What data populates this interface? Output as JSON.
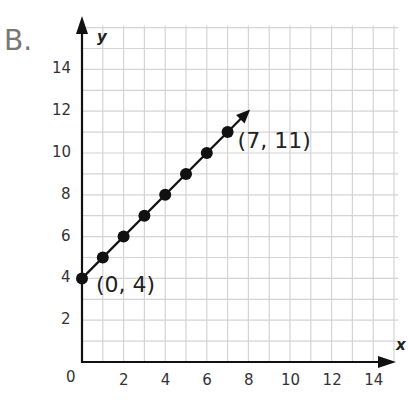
{
  "part_label": "B.",
  "chart_data": {
    "type": "line",
    "title": "",
    "xlabel": "x",
    "ylabel": "y",
    "xlim": [
      0,
      15
    ],
    "ylim": [
      0,
      16
    ],
    "grid": true,
    "x_ticks": [
      "2",
      "4",
      "6",
      "8",
      "10",
      "12",
      "14"
    ],
    "y_ticks": [
      "2",
      "4",
      "6",
      "8",
      "10",
      "12",
      "14"
    ],
    "origin_label": "0",
    "series": [
      {
        "name": "line",
        "x": [
          0,
          1,
          2,
          3,
          4,
          5,
          6,
          7
        ],
        "y": [
          4,
          5,
          6,
          7,
          8,
          9,
          10,
          11
        ],
        "markers": true,
        "arrow_end": true
      }
    ],
    "annotations": [
      {
        "text": "(0, 4)",
        "x": 0,
        "y": 4
      },
      {
        "text": "(7, 11)",
        "x": 7,
        "y": 11
      }
    ]
  }
}
